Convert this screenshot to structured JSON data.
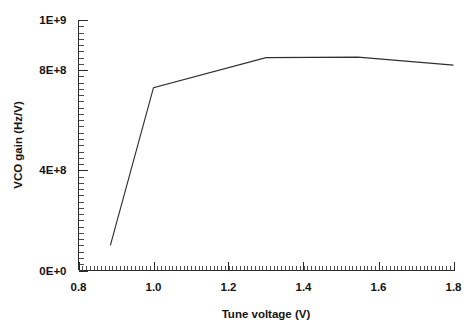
{
  "chart_data": {
    "type": "line",
    "title": "",
    "xlabel": "Tune voltage (V)",
    "ylabel": "VCO gain (Hz/V)",
    "xlim": [
      0.8,
      1.8
    ],
    "ylim": [
      0,
      1000000000
    ],
    "grid": false,
    "legend": null,
    "x_tick_labels": [
      "0.8",
      "1.0",
      "1.2",
      "1.4",
      "1.6",
      "1.8"
    ],
    "x_tick_values": [
      0.8,
      1.0,
      1.2,
      1.4,
      1.6,
      1.8
    ],
    "x_minor_tick_step": 0.01,
    "y_tick_labels": [
      "0E+0",
      "4E+8",
      "8E+8",
      "1E+9"
    ],
    "y_tick_values": [
      0,
      400000000,
      800000000,
      1000000000
    ],
    "y_minor_tick_step": 25000000,
    "series": [
      {
        "name": "VCO gain",
        "color": "#2f2f2f",
        "x": [
          0.885,
          1.0,
          1.3,
          1.545,
          1.8
        ],
        "y": [
          100000000,
          730000000,
          850000000,
          852000000,
          820000000
        ]
      }
    ]
  },
  "axes": {
    "x_title": "Tune voltage (V)",
    "y_title": "VCO gain (Hz/V)"
  },
  "ticks": {
    "x": [
      "0.8",
      "1.0",
      "1.2",
      "1.4",
      "1.6",
      "1.8"
    ],
    "y": [
      "0E+0",
      "4E+8",
      "8E+8",
      "1E+9"
    ]
  },
  "colors": {
    "line": "#2f2f2f",
    "axis": "#2b2b2b",
    "text": "#141414",
    "background": "#ffffff"
  }
}
